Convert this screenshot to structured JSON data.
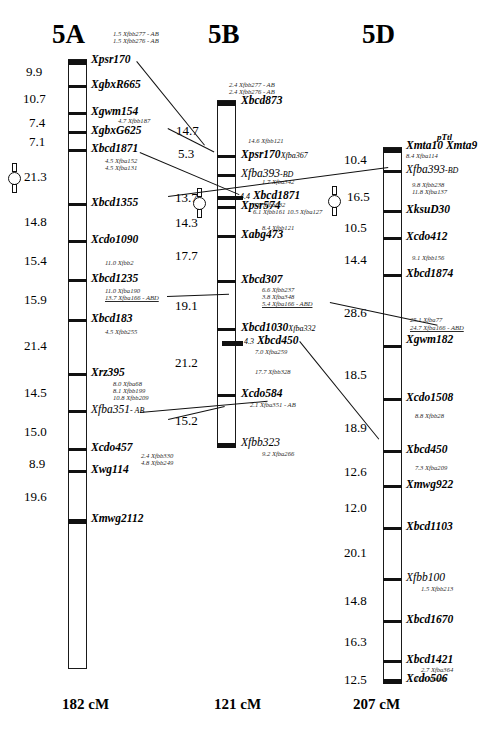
{
  "figure": {
    "type": "genetic-linkage-map",
    "organism_group": "wheat homoeologous group 5",
    "chromosomes": [
      "5A",
      "5B",
      "5D"
    ]
  },
  "titles": {
    "a": "5A",
    "b": "5B",
    "d": "5D"
  },
  "totals": {
    "a": "182 cM",
    "b": "121 cM",
    "d": "207 cM"
  },
  "chr5A": {
    "top_notes": [
      "1.5 Xfbb277 - AB",
      "1.5 Xfbb276 - AB"
    ],
    "loci": [
      {
        "name": "Xpsr170"
      },
      {
        "name": "XgbxR665"
      },
      {
        "name": "Xgwm154",
        "sub": [
          "4.7 Xfbb187"
        ]
      },
      {
        "name": "XgbxG625"
      },
      {
        "name": "Xbcd1871",
        "sub": [
          "4.5 Xfba152",
          "4.5 Xfba131"
        ]
      },
      {
        "name": "Xbcd1355"
      },
      {
        "name": "Xcdo1090",
        "sub": [
          "11.0 Xfbb2"
        ]
      },
      {
        "name": "Xbcd1235",
        "sub": [
          "11.0 Xfba190",
          "13.7 Xfba166 - ABD"
        ]
      },
      {
        "name": "Xbcd183",
        "sub": [
          "4.5 Xfbb255"
        ]
      },
      {
        "name": "Xrz395",
        "sub": [
          "8.0 Xfba68",
          "8.1 Xfbb199",
          "10.8 Xfbb209"
        ]
      },
      {
        "name": "Xfba351",
        "suffix": "- AB",
        "plain": true
      },
      {
        "name": "Xcdo457",
        "sub": [
          "2.4 Xfbb330",
          "4.8 Xfbb249"
        ]
      },
      {
        "name": "Xwg114"
      },
      {
        "name": "Xmwg2112"
      }
    ],
    "distances": [
      "9.9",
      "10.7",
      "7.4",
      "7.1",
      "21.3",
      "14.8",
      "15.4",
      "15.9",
      "21.4",
      "14.5",
      "15.0",
      "8.9",
      "19.6"
    ]
  },
  "chr5B": {
    "top_notes": [
      "2.4 Xfbb277 - AB",
      "2.4 Xfbb276 - AB"
    ],
    "loci": [
      {
        "name": "Xbcd873"
      },
      {
        "name": "Xpsr170",
        "suffix": "Xfba367",
        "sub_above": [
          "14.6 Xfbb121"
        ]
      },
      {
        "name": "Xfba393",
        "suffix": "-BD",
        "plain": true,
        "sub": [
          "1.7 Xfba342"
        ]
      },
      {
        "name": "Xbcd1871",
        "prefix": "4.4",
        "sub": [
          "5.6 Xfba232",
          "6.1 Xfbb161   10.5 Xfba127"
        ]
      },
      {
        "name": "Xpsr574",
        "sub": [
          "8.4 Xfbb121"
        ]
      },
      {
        "name": "Xabg473"
      },
      {
        "name": "Xbcd307",
        "sub": [
          "6.6 Xfbb237",
          "3.8 Xfba348",
          "5.4 Xfba166 - ABD"
        ]
      },
      {
        "name": "Xbcd1030",
        "suffix": "Xfba332"
      },
      {
        "name": "Xbcd450",
        "prefix": "4.3",
        "sub": [
          "7.0 Xfba259",
          "17.7 Xfbb328"
        ]
      },
      {
        "name": "Xcdo584",
        "sub": [
          "2.1 Xfba351 - AB"
        ]
      },
      {
        "name": "Xfbb323",
        "plain": true,
        "sub": [
          "9.2 Xfba266"
        ]
      }
    ],
    "distances": [
      "14.7",
      "5.3",
      "13.7",
      "14.3",
      "17.7",
      "19.1",
      "21.2",
      "15.2"
    ]
  },
  "chr5D": {
    "loci": [
      {
        "name": "Xmta10",
        "suffix2": "Xmta9",
        "above": "pTtl",
        "sub": [
          "8.4 Xfba114"
        ]
      },
      {
        "name": "Xfba393",
        "suffix": "-BD",
        "plain": true,
        "sub": [
          "9.8 Xfbb238",
          "11.8 Xfba137"
        ]
      },
      {
        "name": "XksuD30"
      },
      {
        "name": "Xcdo412",
        "sub": [
          "9.1 Xfbb156"
        ]
      },
      {
        "name": "Xbcd1874"
      },
      {
        "name": "Xgwm182",
        "sub_above": [
          "25.1 Xfba77",
          "24.7 Xfba166 - ABD"
        ]
      },
      {
        "name": "Xcdo1508",
        "sub": [
          "8.8 Xfbb28"
        ]
      },
      {
        "name": "Xbcd450",
        "sub": [
          "7.3 Xfba209"
        ]
      },
      {
        "name": "Xmwg922"
      },
      {
        "name": "Xbcd1103"
      },
      {
        "name": "Xfbb100",
        "sub": [
          "1.5 Xfbb213"
        ]
      },
      {
        "name": "Xbcd1670"
      },
      {
        "name": "Xbcd1421",
        "sub": [
          "2.7 Xfba364",
          "11.0 Xfba11"
        ]
      },
      {
        "name": "Xcdo506"
      }
    ],
    "distances": [
      "10.4",
      "16.5",
      "10.5",
      "14.4",
      "28.6",
      "18.5",
      "18.9",
      "12.6",
      "12.0",
      "20.1",
      "14.8",
      "16.3",
      "12.5"
    ]
  },
  "centromeres": {
    "a": "21.3",
    "b": "13.7",
    "d": "16.5"
  }
}
